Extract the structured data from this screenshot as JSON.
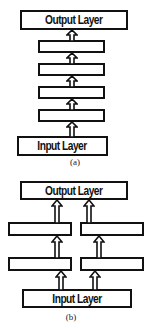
{
  "diagrams": [
    {
      "caption": "(a)",
      "output_label": "Output Layer",
      "input_label": "Input Layer",
      "hidden_layers": 4,
      "structure": "single stacked column"
    },
    {
      "caption": "(b)",
      "output_label": "Output Layer",
      "input_label": "Input Layer",
      "hidden_layers_per_column": 2,
      "columns": 2,
      "structure": "two parallel columns"
    }
  ],
  "colors": {
    "stroke": "#111111",
    "background": "#ffffff"
  }
}
